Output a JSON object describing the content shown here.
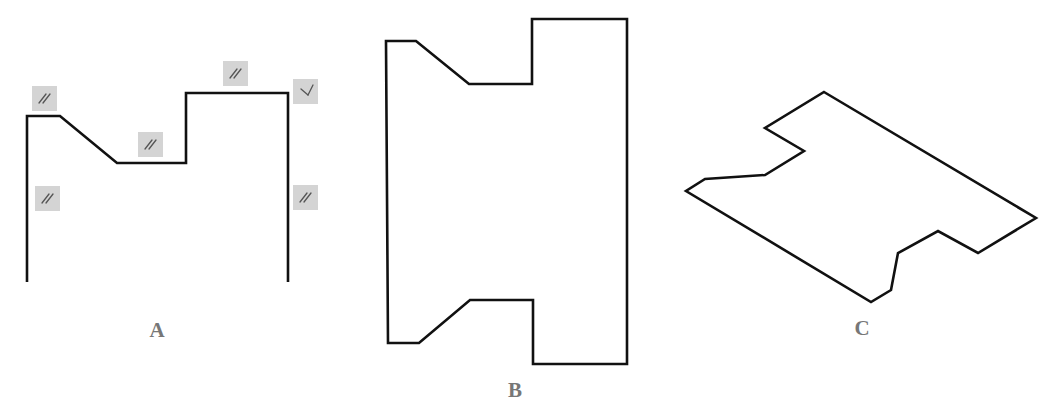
{
  "figures": [
    {
      "id": "A",
      "label": "A",
      "label_pos": [
        157,
        330
      ],
      "kind": "open-polyline",
      "points": [
        [
          27,
          282
        ],
        [
          27,
          116
        ],
        [
          60,
          116
        ],
        [
          117,
          163
        ],
        [
          186,
          163
        ],
        [
          186,
          93
        ],
        [
          288,
          93
        ],
        [
          288,
          282
        ]
      ],
      "constraint_icons": [
        {
          "type": "parallel",
          "icon": "parallel-icon",
          "x": 32,
          "y": 86
        },
        {
          "type": "parallel",
          "icon": "parallel-icon",
          "x": 35,
          "y": 186
        },
        {
          "type": "parallel",
          "icon": "parallel-icon",
          "x": 138,
          "y": 132
        },
        {
          "type": "parallel",
          "icon": "parallel-icon",
          "x": 223,
          "y": 61
        },
        {
          "type": "perpendicular",
          "icon": "perpendicular-icon",
          "x": 293,
          "y": 79
        },
        {
          "type": "parallel",
          "icon": "parallel-icon",
          "x": 293,
          "y": 185
        }
      ]
    },
    {
      "id": "B",
      "label": "B",
      "label_pos": [
        515,
        390
      ],
      "kind": "closed-polygon",
      "points": [
        [
          386,
          41
        ],
        [
          416,
          41
        ],
        [
          469,
          84
        ],
        [
          532,
          84
        ],
        [
          532,
          19
        ],
        [
          627,
          19
        ],
        [
          627,
          364
        ],
        [
          533,
          364
        ],
        [
          533,
          300
        ],
        [
          470,
          300
        ],
        [
          419,
          343
        ],
        [
          388,
          343
        ]
      ]
    },
    {
      "id": "C",
      "label": "C",
      "label_pos": [
        862,
        328
      ],
      "kind": "closed-polygon",
      "points": [
        [
          824,
          92
        ],
        [
          1036,
          218
        ],
        [
          978,
          253
        ],
        [
          938,
          231
        ],
        [
          898,
          253
        ],
        [
          891,
          290
        ],
        [
          871,
          302
        ],
        [
          686,
          191
        ],
        [
          705,
          179
        ],
        [
          765,
          175
        ],
        [
          804,
          151
        ],
        [
          765,
          128
        ]
      ]
    }
  ],
  "colors": {
    "stroke": "#111111",
    "label": "#777777",
    "icon_bg": "#d4d4d4",
    "icon_glyph": "#555555"
  }
}
